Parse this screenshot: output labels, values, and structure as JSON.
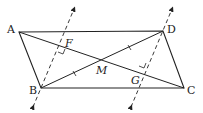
{
  "diagram": {
    "type": "geometry",
    "shape": "parallelogram ABCD with diagonals AC and BD intersecting at M; dashed lines through B and D perpendicular to AC at F and G",
    "colors": {
      "stroke": "#222222",
      "background": "#ffffff"
    },
    "points": {
      "A": {
        "label": "A",
        "x": 19,
        "y": 32
      },
      "B": {
        "label": "B",
        "x": 41,
        "y": 88
      },
      "C": {
        "label": "C",
        "x": 184,
        "y": 88
      },
      "D": {
        "label": "D",
        "x": 163,
        "y": 31
      },
      "M": {
        "label": "M",
        "x": 101,
        "y": 60
      },
      "F": {
        "label": "F"
      },
      "G": {
        "label": "G"
      }
    },
    "segments": [
      "AD",
      "BC",
      "AB",
      "DC",
      "AC",
      "BD"
    ],
    "dashed_lines": [
      "line through B perpendicular to AC at F",
      "line through D perpendicular to AC at G"
    ],
    "marks": [
      "right angle at F",
      "right angle at G",
      "tick on BM",
      "tick on MD"
    ]
  }
}
